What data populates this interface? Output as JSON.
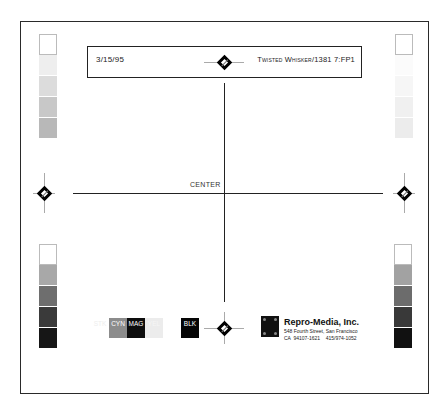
{
  "header": {
    "date": "3/15/95",
    "job_slug": "Twisted Whisker/1381 7:FP1"
  },
  "center_label": "CENTER",
  "registration_marks": [
    "top",
    "left",
    "right",
    "bottom"
  ],
  "tone_strips": {
    "top_left": [
      "#ffffff",
      "#eeeeee",
      "#dcdcdc",
      "#c8c8c8",
      "#b8b8b8"
    ],
    "top_right": [
      "#ffffff",
      "#fbfbfb",
      "#f6f6f6",
      "#f0f0f0",
      "#ececec"
    ],
    "bottom_left": [
      "#ffffff",
      "#a8a8a8",
      "#6e6e6e",
      "#3a3a3a",
      "#161616"
    ],
    "bottom_right": [
      "#ffffff",
      "#a2a2a2",
      "#6c6c6c",
      "#393939",
      "#111111"
    ]
  },
  "color_swatches": [
    {
      "label": "STK",
      "color": "#ffffff",
      "text_color": "#eeeeee"
    },
    {
      "label": "CYN",
      "color": "#8c8c8c",
      "text_color": "#ffffff"
    },
    {
      "label": "MAG",
      "color": "#0d0d0d",
      "text_color": "#ffffff"
    },
    {
      "label": "YEL",
      "color": "#ececec",
      "text_color": "#f6f6f6"
    },
    {
      "label": "",
      "color": "#ffffff",
      "text_color": "#ffffff"
    },
    {
      "label": "BLK",
      "color": "#050505",
      "text_color": "#ffffff"
    }
  ],
  "company": {
    "name": "Repro-Media, Inc.",
    "address_line1": "548 Fourth Street, San Francisco",
    "address_line2": "CA  94107-1621    415/974-1052"
  }
}
